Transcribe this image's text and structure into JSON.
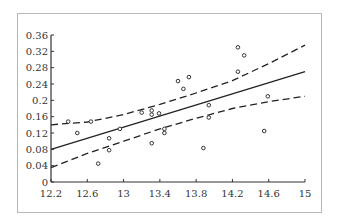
{
  "chart_data": {
    "type": "scatter",
    "title": "",
    "xlabel": "",
    "ylabel": "",
    "xlim": [
      12.2,
      15
    ],
    "ylim": [
      0,
      0.36
    ],
    "grid": false,
    "legend": null,
    "x_ticks": [
      "12.2",
      "12.6",
      "13",
      "13.4",
      "13.8",
      "14.2",
      "14.6",
      "15"
    ],
    "y_ticks": [
      "0",
      "0.04",
      "0.08",
      "0.12",
      "0.16",
      "0.2",
      "0.24",
      "0.28",
      "0.32",
      "0.36"
    ],
    "series": [
      {
        "name": "observations",
        "kind": "scatter",
        "marker": "open-circle",
        "points": [
          [
            12.39,
            0.148
          ],
          [
            12.49,
            0.12
          ],
          [
            12.64,
            0.148
          ],
          [
            12.72,
            0.045
          ],
          [
            12.84,
            0.107
          ],
          [
            12.84,
            0.078
          ],
          [
            12.96,
            0.13
          ],
          [
            13.2,
            0.17
          ],
          [
            13.31,
            0.175
          ],
          [
            13.31,
            0.165
          ],
          [
            13.39,
            0.168
          ],
          [
            13.31,
            0.095
          ],
          [
            13.45,
            0.13
          ],
          [
            13.45,
            0.12
          ],
          [
            13.6,
            0.247
          ],
          [
            13.66,
            0.228
          ],
          [
            13.72,
            0.257
          ],
          [
            13.88,
            0.083
          ],
          [
            13.94,
            0.188
          ],
          [
            13.94,
            0.158
          ],
          [
            14.26,
            0.33
          ],
          [
            14.33,
            0.31
          ],
          [
            14.26,
            0.27
          ],
          [
            14.59,
            0.21
          ],
          [
            14.55,
            0.125
          ]
        ]
      },
      {
        "name": "regression-fit",
        "kind": "line",
        "style": "solid",
        "points": [
          [
            12.2,
            0.08
          ],
          [
            15,
            0.27
          ]
        ]
      },
      {
        "name": "upper-confidence-band",
        "kind": "line",
        "style": "dashed",
        "points": [
          [
            12.2,
            0.14
          ],
          [
            12.6,
            0.147
          ],
          [
            13.0,
            0.165
          ],
          [
            13.4,
            0.19
          ],
          [
            13.8,
            0.218
          ],
          [
            14.2,
            0.248
          ],
          [
            14.6,
            0.29
          ],
          [
            15,
            0.335
          ]
        ]
      },
      {
        "name": "lower-confidence-band",
        "kind": "line",
        "style": "dashed",
        "points": [
          [
            12.2,
            0.035
          ],
          [
            12.6,
            0.07
          ],
          [
            13.0,
            0.1
          ],
          [
            13.4,
            0.13
          ],
          [
            13.8,
            0.156
          ],
          [
            14.2,
            0.18
          ],
          [
            14.6,
            0.197
          ],
          [
            15,
            0.21
          ]
        ]
      }
    ]
  }
}
